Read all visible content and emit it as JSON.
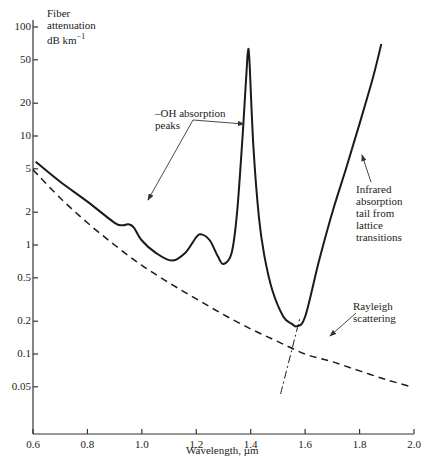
{
  "chart_data": {
    "type": "line",
    "title": "",
    "xlabel": "Wavelength, µm",
    "ylabel": "Fiber attenuation dB km⁻¹",
    "ylabel_lines": [
      "Fiber",
      "attenuation",
      "dB km⁻¹"
    ],
    "xscale": "linear",
    "yscale": "log",
    "xlim": [
      0.6,
      2.0
    ],
    "ylim": [
      0.02,
      100
    ],
    "xticks": [
      "0.6",
      "0.8",
      "1.0",
      "1.2",
      "1.4",
      "1.6",
      "1.8",
      "2.0"
    ],
    "yticks": [
      "100",
      "50",
      "20",
      "10",
      "5",
      "2",
      "1",
      "0.5",
      "0.2",
      "0.1",
      "0.05"
    ],
    "grid": false,
    "legend": null,
    "series": [
      {
        "name": "Measured fiber attenuation",
        "style": "solid",
        "x": [
          0.61,
          0.7,
          0.8,
          0.9,
          0.93,
          0.95,
          0.97,
          1.0,
          1.05,
          1.11,
          1.16,
          1.2,
          1.22,
          1.25,
          1.28,
          1.3,
          1.33,
          1.35,
          1.37,
          1.385,
          1.39,
          1.395,
          1.41,
          1.43,
          1.45,
          1.48,
          1.52,
          1.55,
          1.57,
          1.6,
          1.65,
          1.7,
          1.75,
          1.8,
          1.85,
          1.88
        ],
        "values": [
          5.8,
          3.8,
          2.5,
          1.6,
          1.52,
          1.55,
          1.45,
          1.1,
          0.85,
          0.72,
          0.85,
          1.18,
          1.25,
          1.1,
          0.78,
          0.67,
          0.85,
          2.0,
          10.0,
          40.0,
          60.0,
          50.0,
          8.0,
          1.8,
          0.8,
          0.38,
          0.22,
          0.19,
          0.18,
          0.22,
          0.7,
          2.0,
          5.0,
          13.0,
          35.0,
          70.0
        ]
      },
      {
        "name": "Rayleigh scattering",
        "style": "dashed",
        "x": [
          0.6,
          0.7,
          0.8,
          0.9,
          1.0,
          1.1,
          1.2,
          1.3,
          1.4,
          1.5,
          1.6,
          1.7,
          1.8,
          1.9,
          1.99
        ],
        "values": [
          4.9,
          2.7,
          1.6,
          1.0,
          0.65,
          0.45,
          0.32,
          0.23,
          0.17,
          0.13,
          0.1,
          0.085,
          0.07,
          0.058,
          0.05
        ]
      },
      {
        "name": "Infrared absorption tail extrapolation",
        "style": "dash-dot",
        "x": [
          1.51,
          1.58
        ],
        "values": [
          0.043,
          0.21
        ]
      }
    ],
    "annotations": [
      {
        "text": "–OH absorption peaks",
        "points_to": [
          [
            0.95,
            1.52
          ],
          [
            1.385,
            15.0
          ]
        ]
      },
      {
        "text": "Infrared absorption tail from lattice transitions",
        "points_to": [
          [
            1.78,
            10.0
          ]
        ]
      },
      {
        "text": "Rayleigh scattering",
        "points_to": [
          [
            1.7,
            0.095
          ]
        ]
      }
    ]
  },
  "labels": {
    "ylabel_line1": "Fiber",
    "ylabel_line2": "attenuation",
    "ylabel_line3": "dB km",
    "ylabel_sup": "−1",
    "xlabel": "Wavelength, µm",
    "oh_line1": "–OH absorption",
    "oh_line2": "peaks",
    "ir_line1": "Infrared",
    "ir_line2": "absorption",
    "ir_line3": "tail from",
    "ir_line4": "lattice",
    "ir_line5": "transitions",
    "ray_line1": "Rayleigh",
    "ray_line2": "scattering"
  }
}
